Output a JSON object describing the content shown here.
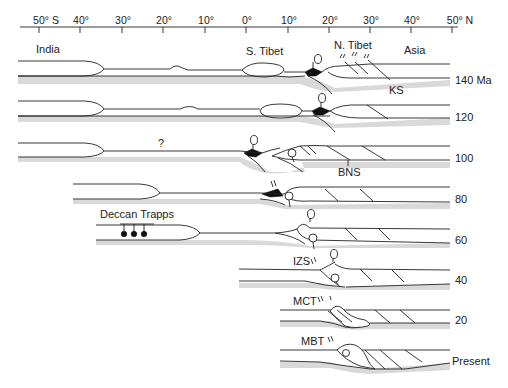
{
  "axis": {
    "ticks": [
      {
        "label": "50° S",
        "x": 39
      },
      {
        "label": "40°",
        "x": 80
      },
      {
        "label": "30°",
        "x": 122
      },
      {
        "label": "20°",
        "x": 163
      },
      {
        "label": "10°",
        "x": 205
      },
      {
        "label": "0°",
        "x": 246
      },
      {
        "label": "10°",
        "x": 288
      },
      {
        "label": "20°",
        "x": 329
      },
      {
        "label": "30°",
        "x": 370
      },
      {
        "label": "40°",
        "x": 411
      },
      {
        "label": "50° N",
        "x": 452
      }
    ]
  },
  "regions": {
    "india": "India",
    "s_tibet": "S. Tibet",
    "n_tibet": "N. Tibet",
    "asia": "Asia"
  },
  "ages": [
    "140 Ma",
    "120",
    "100",
    "80",
    "60",
    "40",
    "20",
    "Present"
  ],
  "annotations": {
    "ks": "KS",
    "question": "?",
    "bns": "BNS",
    "deccan": "Deccan Trapps",
    "izs": "IZS",
    "mct": "MCT",
    "mbt": "MBT"
  },
  "colors": {
    "line": "#222222",
    "mantle_shade": "#d9d9d9",
    "fill_black": "#111111"
  }
}
